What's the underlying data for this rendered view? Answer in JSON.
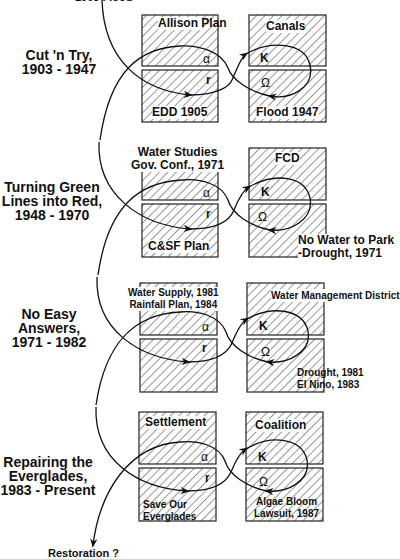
{
  "top_cut_text": "1903 Flood",
  "eras": [
    {
      "title_line1": "Cut 'n Try,",
      "title_line2": "1903 - 1947",
      "title_line3": "",
      "alpha_box": "Allison Plan",
      "r_box": "EDD 1905",
      "k_box": "Canals",
      "omega_box": "Flood 1947"
    },
    {
      "title_line1": "Turning Green",
      "title_line2": "Lines into Red,",
      "title_line3": "1948 - 1970",
      "alpha_box_line1": "Water Studies",
      "alpha_box_line2": "Gov. Conf., 1971",
      "r_box": "C&SF Plan",
      "k_box": "FCD",
      "omega_box_line1": "No Water to Park",
      "omega_box_line2": "-Drought, 1971"
    },
    {
      "title_line1": "No Easy",
      "title_line2": "Answers,",
      "title_line3": "1971 - 1982",
      "alpha_box_line1": "Water Supply, 1981",
      "alpha_box_line2": "Rainfall Plan, 1984",
      "r_box": "",
      "k_box": "Water Management District",
      "omega_box_line1": "Drought, 1981",
      "omega_box_line2": "El Nino, 1983"
    },
    {
      "title_line1": "Repairing the",
      "title_line2": "Everglades,",
      "title_line3": "1983 - Present",
      "alpha_box": "Settlement",
      "r_box_line1": "Save Our",
      "r_box_line2": "Everglades",
      "k_box": "Coalition",
      "omega_box_line1": "Algae Bloom",
      "omega_box_line2": "Lawsuit, 1987"
    }
  ],
  "symbols": {
    "alpha": "α",
    "r": "r",
    "k": "K",
    "omega": "Ω"
  },
  "final_label": "Restoration ?"
}
